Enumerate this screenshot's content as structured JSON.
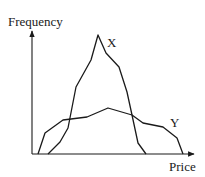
{
  "chart_data": {
    "type": "line",
    "title": "",
    "xlabel": "Price",
    "ylabel": "Frequency",
    "grid": false,
    "ticks": false,
    "legend": "inline labels at curve ends",
    "series": [
      {
        "name": "X",
        "description": "Tall, narrow distribution (low price dispersion, high peak frequency)",
        "points_px": [
          [
            48,
            154
          ],
          [
            60,
            142
          ],
          [
            68,
            128
          ],
          [
            76,
            87
          ],
          [
            91,
            60
          ],
          [
            98,
            35
          ],
          [
            106,
            53
          ],
          [
            119,
            67
          ],
          [
            127,
            92
          ],
          [
            132,
            115
          ],
          [
            138,
            143
          ],
          [
            146,
            154
          ]
        ],
        "label_pos_px": [
          107,
          36
        ]
      },
      {
        "name": "Y",
        "description": "Low, wide distribution (high price dispersion, low peak frequency)",
        "points_px": [
          [
            38,
            154
          ],
          [
            45,
            133
          ],
          [
            63,
            120
          ],
          [
            87,
            117
          ],
          [
            108,
            108
          ],
          [
            132,
            115
          ],
          [
            143,
            123
          ],
          [
            163,
            127
          ],
          [
            177,
            138
          ],
          [
            183,
            154
          ]
        ],
        "label_pos_px": [
          170,
          116
        ]
      }
    ],
    "axes_px": {
      "origin": [
        32,
        154
      ],
      "y_axis_top": [
        32,
        31
      ],
      "x_axis_right": [
        194,
        154
      ]
    }
  },
  "labels": {
    "y_axis": "Frequency",
    "x_axis": "Price",
    "series_x": "X",
    "series_y": "Y"
  },
  "colors": {
    "line": "#1a1a1a",
    "background": "#ffffff"
  }
}
